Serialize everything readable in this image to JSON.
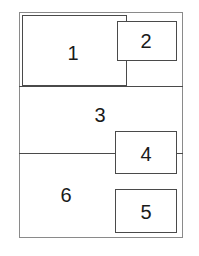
{
  "diagram": {
    "type": "layout-regions",
    "regions": [
      {
        "id": "1",
        "label": "1"
      },
      {
        "id": "2",
        "label": "2"
      },
      {
        "id": "3",
        "label": "3"
      },
      {
        "id": "4",
        "label": "4"
      },
      {
        "id": "5",
        "label": "5"
      },
      {
        "id": "6",
        "label": "6"
      }
    ],
    "colors": {
      "line": "#4a4a4a",
      "frame": "#8a8a8a",
      "background": "#ffffff"
    }
  }
}
